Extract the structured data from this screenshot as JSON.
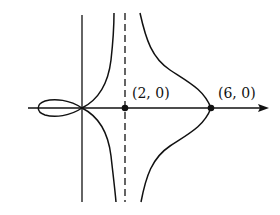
{
  "diagram": {
    "type": "curve-sketch",
    "labels": {
      "point_a": "(2, 0)",
      "point_b": "(6, 0)"
    },
    "points": [
      {
        "label": "(2, 0)",
        "x": 2,
        "y": 0
      },
      {
        "label": "(6, 0)",
        "x": 6,
        "y": 0
      }
    ],
    "asymptote": {
      "x": 2,
      "style": "dashed"
    },
    "colors": {
      "stroke": "#111111",
      "background": "#ffffff"
    }
  }
}
